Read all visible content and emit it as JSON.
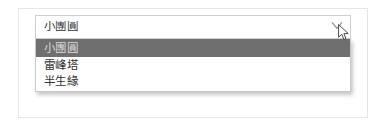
{
  "app": {
    "background_color": "#ffffff",
    "card_border_color": "#e6e6e6"
  },
  "combobox": {
    "name": "book-title-combobox",
    "value": "小團圓",
    "placeholder": "",
    "expanded": true,
    "clear_icon": "clear-chevron-icon",
    "field_border_color": "#cfcfcf",
    "text_color": "#3a3a3a",
    "options": [
      {
        "label": "小團圓",
        "selected": true
      },
      {
        "label": "雷峰塔",
        "selected": false
      },
      {
        "label": "半生緣",
        "selected": false
      }
    ],
    "highlight_color": "#6f6f6f",
    "highlight_text_color": "#d9d9d9"
  },
  "cursor": {
    "name": "mouse-pointer",
    "x": 338,
    "y": 24
  }
}
